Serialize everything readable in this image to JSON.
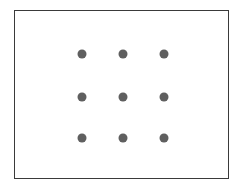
{
  "diagram": {
    "type": "dot-grid",
    "rows": 3,
    "columns": 3,
    "frame": {
      "border_color": "#3a3a3a",
      "background": "#ffffff"
    },
    "dot_color": "#5f5f5f",
    "dot_diameter": 9,
    "column_x": [
      82,
      123,
      164
    ],
    "row_y": [
      54,
      97,
      138
    ],
    "dots": [
      {
        "row": 1,
        "col": 1
      },
      {
        "row": 1,
        "col": 2
      },
      {
        "row": 1,
        "col": 3
      },
      {
        "row": 2,
        "col": 1
      },
      {
        "row": 2,
        "col": 2
      },
      {
        "row": 2,
        "col": 3
      },
      {
        "row": 3,
        "col": 1
      },
      {
        "row": 3,
        "col": 2
      },
      {
        "row": 3,
        "col": 3
      }
    ]
  }
}
